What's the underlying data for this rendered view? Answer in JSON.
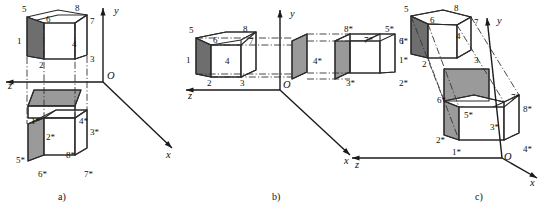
{
  "figure": {
    "background": "#ffffff",
    "ink": "#1a1a1a",
    "face_colors": {
      "white": "#ffffff",
      "gray": "#9a9a9a",
      "dark": "#6e6e6e"
    },
    "line_styles": {
      "edge": "solid",
      "projection": "dash-dot",
      "axis": "solid-with-arrow"
    }
  },
  "panels": [
    {
      "id": "a",
      "caption": "a)",
      "caption_pos": [
        58,
        200
      ],
      "description": "Box above the xOz plane and its mirror image below it",
      "axes": {
        "origin": [
          103,
          82
        ],
        "origin_label": "O",
        "origin_label_pos": [
          107,
          79
        ],
        "items": [
          {
            "name": "y",
            "label": "y",
            "label_pos": [
              114,
              14
            ],
            "from": [
              103,
              82
            ],
            "to": [
              103,
              8
            ]
          },
          {
            "name": "z",
            "label": "z",
            "label_pos": [
              8,
              89
            ],
            "from": [
              103,
              82
            ],
            "to": [
              6,
              82
            ]
          },
          {
            "name": "x",
            "label": "x",
            "label_pos": [
              166,
              158
            ],
            "from": [
              103,
              82
            ],
            "to": [
              172,
              148
            ]
          }
        ]
      },
      "shapes": [
        {
          "name": "top-face-upper-box",
          "fill": "white",
          "points": "33,21 58,15 87,15 75,23 75,24 44,24 44,23"
        },
        {
          "name": "back-top-edge-upper",
          "fill": "none",
          "points": ""
        },
        {
          "name": "left-face-upper-box",
          "fill": "dark",
          "points": "27,17 44,23 44,59 27,56"
        },
        {
          "name": "front-face-upper-box",
          "fill": "white",
          "points": "44,23 75,23 75,59 44,59"
        },
        {
          "name": "right-top-upper-box",
          "fill": "white",
          "points": "75,23 87,15 87,55 75,59"
        },
        {
          "name": "mirror-plane-face",
          "fill": "gray",
          "points": "34,90 81,90 75,106 28,106"
        },
        {
          "name": "mirror-under-face",
          "fill": "white",
          "points": "28,106 75,106 75,118 28,118"
        },
        {
          "name": "top-face-lower-box",
          "fill": "white",
          "points": "44,118 75,118 87,110 56,110"
        },
        {
          "name": "left-face-lower-box",
          "fill": "gray",
          "points": "28,124 44,118 44,155 28,161"
        },
        {
          "name": "front-face-lower-box",
          "fill": "white",
          "points": "44,118 75,118 75,155 44,155"
        },
        {
          "name": "right-face-lower-box",
          "fill": "white",
          "points": "75,118 87,110 87,148 75,155"
        }
      ],
      "edges": [
        "27,17 58,10 87,15 87,55 75,59 44,59 27,56 27,17",
        "27,17 44,23 75,23 87,15",
        "44,23 44,59",
        "75,23 75,59",
        "34,90 81,90 75,106 28,106 34,90",
        "28,106 75,106",
        "28,106 28,118 75,118 75,106",
        "28,124 56,110 87,110 87,148 75,155 44,155 28,161 28,124",
        "28,124 44,118 75,118 87,110",
        "44,118 44,155",
        "75,118 75,155"
      ],
      "projections": [
        "44,24 44,118",
        "75,24 75,118",
        "27,57 27,124",
        "87,56 87,110"
      ],
      "vertex_labels": [
        {
          "text": "5",
          "x": 22,
          "y": 12
        },
        {
          "text": "6",
          "x": 46,
          "y": 22
        },
        {
          "text": "8",
          "x": 75,
          "y": 11
        },
        {
          "text": "7",
          "x": 90,
          "y": 24
        },
        {
          "text": "1",
          "x": 17,
          "y": 44
        },
        {
          "text": "4",
          "x": 72,
          "y": 47
        },
        {
          "text": "2",
          "x": 39,
          "y": 68
        },
        {
          "text": "3",
          "x": 90,
          "y": 62
        },
        {
          "text": "1*",
          "x": 31,
          "y": 124
        },
        {
          "text": "4*",
          "x": 79,
          "y": 124
        },
        {
          "text": "2*",
          "x": 46,
          "y": 140
        },
        {
          "text": "3*",
          "x": 90,
          "y": 135
        },
        {
          "text": "5*",
          "x": 16,
          "y": 163
        },
        {
          "text": "8*",
          "x": 66,
          "y": 158
        },
        {
          "text": "6*",
          "x": 38,
          "y": 177
        },
        {
          "text": "7*",
          "x": 84,
          "y": 177
        }
      ]
    },
    {
      "id": "b",
      "caption": "b)",
      "caption_pos": [
        272,
        200
      ],
      "description": "Box left of the yOz plane and its mirror image to the right",
      "axes": {
        "origin": [
          280,
          90
        ],
        "origin_label": "O",
        "origin_label_pos": [
          283,
          88
        ],
        "items": [
          {
            "name": "y",
            "label": "y",
            "label_pos": [
              290,
              17
            ],
            "from": [
              280,
              90
            ],
            "to": [
              280,
              10
            ]
          },
          {
            "name": "z",
            "label": "z",
            "label_pos": [
              188,
              99
            ],
            "from": [
              280,
              90
            ],
            "to": [
              186,
              90
            ]
          },
          {
            "name": "x",
            "label": "x",
            "label_pos": [
              344,
              164
            ],
            "from": [
              280,
              90
            ],
            "to": [
              350,
              155
            ]
          }
        ]
      },
      "shapes": [
        {
          "name": "left-face-box",
          "fill": "dark",
          "points": "196,38 211,45 211,77 196,74"
        },
        {
          "name": "top-face-box",
          "fill": "white",
          "points": "196,38 226,32 256,32 241,40 211,45"
        },
        {
          "name": "front-face-box",
          "fill": "white",
          "points": "211,45 241,45 241,77 211,77"
        },
        {
          "name": "right-top-box",
          "fill": "white",
          "points": "241,40 256,32 256,70 241,77"
        },
        {
          "name": "mirror-plane-strip",
          "fill": "gray",
          "points": "292,41 307,34 307,72 292,79"
        },
        {
          "name": "mirror-face-2",
          "fill": "gray",
          "points": "335,41 350,34 350,72 335,79"
        },
        {
          "name": "top-face-box-star",
          "fill": "white",
          "points": "335,41 350,34 380,34 365,41"
        },
        {
          "name": "front-face-box-star",
          "fill": "white",
          "points": "350,41 380,41 380,73 350,73"
        },
        {
          "name": "right-face-box-star",
          "fill": "white",
          "points": "380,34 395,34 395,72 380,73"
        }
      ],
      "edges": [
        "196,38 226,32 256,32 256,70 241,77 211,77 196,74 196,38",
        "196,38 211,45 241,45 256,32",
        "211,45 211,77",
        "241,45 241,77",
        "292,41 307,34 307,72 292,79 292,41",
        "335,41 350,34 350,72 335,79 335,41",
        "350,34 380,34 395,34 395,72 380,73 350,73",
        "350,41 380,41 380,73",
        "350,34 350,73",
        "365,41 380,34",
        "380,41 395,34"
      ],
      "projections": [
        "196,38 292,38",
        "211,45 292,45",
        "211,77 292,77",
        "196,74 292,74",
        "307,34 350,34",
        "307,41 350,41",
        "307,73 350,73",
        "307,79 350,79"
      ],
      "vertex_labels": [
        {
          "text": "5",
          "x": 189,
          "y": 33
        },
        {
          "text": "6",
          "x": 213,
          "y": 43
        },
        {
          "text": "8",
          "x": 243,
          "y": 32
        },
        {
          "text": "7",
          "x": 249,
          "y": 44
        },
        {
          "text": "1",
          "x": 186,
          "y": 63
        },
        {
          "text": "4",
          "x": 225,
          "y": 64
        },
        {
          "text": "2",
          "x": 207,
          "y": 86
        },
        {
          "text": "3",
          "x": 240,
          "y": 86
        },
        {
          "text": "4*",
          "x": 313,
          "y": 64
        },
        {
          "text": "8*",
          "x": 344,
          "y": 32
        },
        {
          "text": "7*",
          "x": 364,
          "y": 43
        },
        {
          "text": "5*",
          "x": 385,
          "y": 32
        },
        {
          "text": "6*",
          "x": 399,
          "y": 44
        },
        {
          "text": "1*",
          "x": 399,
          "y": 63
        },
        {
          "text": "3*",
          "x": 346,
          "y": 86
        },
        {
          "text": "2*",
          "x": 399,
          "y": 86
        }
      ]
    },
    {
      "id": "c",
      "caption": "c)",
      "caption_pos": [
        475,
        200
      ],
      "description": "Box and its mirror image through the origin along the projection direction",
      "axes": {
        "origin": [
          502,
          158
        ],
        "origin_label": "O",
        "origin_label_pos": [
          504,
          160
        ],
        "items": [
          {
            "name": "y",
            "label": "y",
            "label_pos": [
              497,
              24
            ],
            "from": [
              502,
              158
            ],
            "to": [
              487,
              18
            ]
          },
          {
            "name": "z",
            "label": "z",
            "label_pos": [
              355,
              168
            ],
            "from": [
              502,
              158
            ],
            "to": [
              352,
              158
            ]
          },
          {
            "name": "x",
            "label": "x",
            "label_pos": [
              530,
              186
            ],
            "from": [
              502,
              158
            ],
            "to": [
              537,
              178
            ]
          }
        ]
      },
      "shapes": [
        {
          "name": "left-face-box",
          "fill": "dark",
          "points": "411,16 428,24 428,58 411,54"
        },
        {
          "name": "top-face-box",
          "fill": "white",
          "points": "411,16 443,10 471,17 457,25 428,24"
        },
        {
          "name": "front-face-box",
          "fill": "white",
          "points": "428,24 457,25 457,58 428,58"
        },
        {
          "name": "right-face-box",
          "fill": "white",
          "points": "457,25 471,17 471,50 457,58"
        },
        {
          "name": "mirror-plane-face",
          "fill": "gray",
          "points": "444,69 489,69 489,101 444,101"
        },
        {
          "name": "left-face-box-star",
          "fill": "gray",
          "points": "444,101 459,107 459,140 444,135"
        },
        {
          "name": "top-face-box-star",
          "fill": "white",
          "points": "444,101 474,95 504,102 489,109 459,107"
        },
        {
          "name": "front-face-box-star",
          "fill": "white",
          "points": "459,107 504,107 504,140 459,140"
        },
        {
          "name": "right-face-box-star",
          "fill": "white",
          "points": "504,102 519,95 519,133 504,140"
        }
      ],
      "edges": [
        "411,16 443,10 471,17 471,50 457,58 428,58 411,54 411,16",
        "411,16 428,24 457,25 471,17",
        "428,24 428,58",
        "457,25 457,58",
        "444,69 489,69 489,101 444,101 444,69",
        "444,101 459,107 504,107 519,95",
        "444,101 474,95 504,102 519,95 519,133 504,140 459,140 444,135 444,101",
        "459,107 459,140",
        "504,102 504,140"
      ],
      "projections": [
        "428,24 459,107",
        "411,16 444,101",
        "471,17 519,95",
        "457,25 504,102",
        "428,58 459,140"
      ],
      "vertex_labels": [
        {
          "text": "5",
          "x": 404,
          "y": 12
        },
        {
          "text": "6",
          "x": 430,
          "y": 23
        },
        {
          "text": "8",
          "x": 454,
          "y": 11
        },
        {
          "text": "7",
          "x": 474,
          "y": 25
        },
        {
          "text": "1",
          "x": 400,
          "y": 44
        },
        {
          "text": "4",
          "x": 456,
          "y": 39
        },
        {
          "text": "2",
          "x": 422,
          "y": 67
        },
        {
          "text": "3",
          "x": 474,
          "y": 63
        },
        {
          "text": "6*",
          "x": 437,
          "y": 103
        },
        {
          "text": "7*",
          "x": 511,
          "y": 100
        },
        {
          "text": "5*",
          "x": 464,
          "y": 118
        },
        {
          "text": "8*",
          "x": 523,
          "y": 112
        },
        {
          "text": "3*",
          "x": 490,
          "y": 130
        },
        {
          "text": "2*",
          "x": 436,
          "y": 143
        },
        {
          "text": "1*",
          "x": 452,
          "y": 155
        },
        {
          "text": "4*",
          "x": 523,
          "y": 152
        }
      ]
    }
  ]
}
